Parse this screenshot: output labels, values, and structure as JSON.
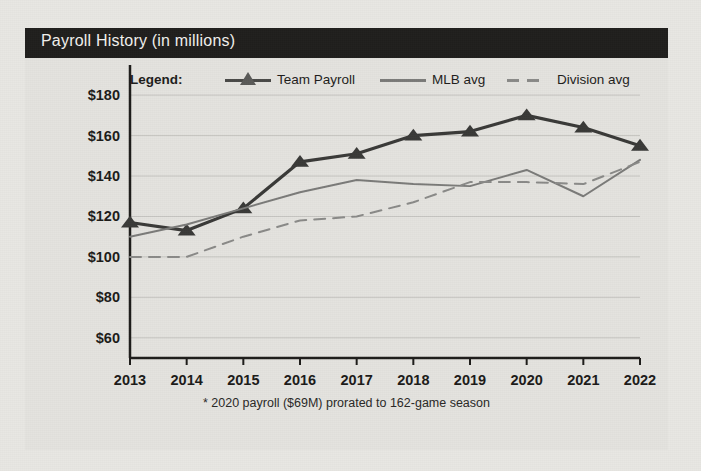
{
  "card": {
    "title": "Payroll History (in millions)",
    "footnote": "* 2020 payroll ($69M) prorated to 162-game season"
  },
  "legend": {
    "label": "Legend:",
    "entries": [
      {
        "name": "Team Payroll",
        "style": "solid-marker",
        "color": "#3a3a38"
      },
      {
        "name": "MLB avg",
        "style": "solid",
        "color": "#7b7b79"
      },
      {
        "name": "Division avg",
        "style": "dashed",
        "color": "#8a8a88"
      }
    ]
  },
  "chart_data": {
    "type": "line",
    "title": "Payroll History (in millions)",
    "xlabel": "",
    "ylabel": "",
    "categories": [
      "2013",
      "2014",
      "2015",
      "2016",
      "2017",
      "2018",
      "2019",
      "2020",
      "2021",
      "2022"
    ],
    "ytick_labels": [
      "$180",
      "$160",
      "$140",
      "$120",
      "$100",
      "$80",
      "$60"
    ],
    "ytick_values": [
      180,
      160,
      140,
      120,
      100,
      80,
      60
    ],
    "ylim": [
      50,
      186
    ],
    "grid": true,
    "legend_position": "top",
    "series": [
      {
        "name": "Team Payroll",
        "color": "#3a3a38",
        "style": "solid",
        "marker": "triangle",
        "values": [
          117,
          113,
          124,
          147,
          151,
          160,
          162,
          170,
          164,
          155
        ]
      },
      {
        "name": "MLB avg",
        "color": "#7b7b79",
        "style": "solid",
        "marker": "none",
        "values": [
          110,
          116,
          124,
          132,
          138,
          136,
          135,
          143,
          130,
          148
        ]
      },
      {
        "name": "Division avg",
        "color": "#8a8a88",
        "style": "dashed",
        "marker": "none",
        "values": [
          100,
          100,
          110,
          118,
          120,
          127,
          137,
          137,
          136,
          147
        ]
      }
    ],
    "annotation": "* 2020 payroll ($69M) prorated to 162-game season"
  }
}
